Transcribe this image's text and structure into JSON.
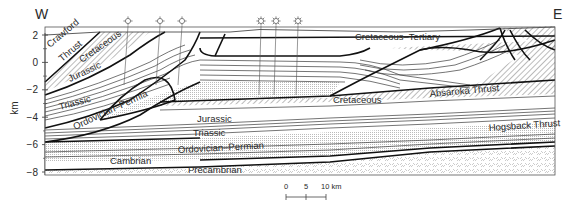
{
  "figure": {
    "direction_left": "W",
    "direction_right": "E",
    "axis": {
      "label": "km",
      "ticks": [
        {
          "value": 2,
          "label": "2"
        },
        {
          "value": 0,
          "label": "0"
        },
        {
          "value": -2,
          "label": "−2"
        },
        {
          "value": -4,
          "label": "−4"
        },
        {
          "value": -6,
          "label": "−6"
        },
        {
          "value": -8,
          "label": "−8"
        }
      ]
    },
    "unit_labels": {
      "crawford_thrust_1": "Crawford",
      "crawford_thrust_2": "Thrust",
      "cretaceous_upper": "Cretaceous",
      "jurassic_upper": "Jurassic",
      "triassic_upper": "Triassic",
      "ordovician_permian_upper": "Ordovician–Permia",
      "cretaceous_tertiary": "Cretaceous–Tertiary",
      "cretaceous_lower": "Cretaceous",
      "absaroka_thrust": "Absaroka Thrust",
      "jurassic_lower": "Jurassic",
      "triassic_lower": "Triassic",
      "hogsback_thrust": "Hogsback Thrust",
      "ordovician_permian_lower": "Ordovician–Permian",
      "cambrian": "Cambrian",
      "precambrian": "Precambrian"
    },
    "wells": [
      {
        "symbol": "dry-hole",
        "x": 128
      },
      {
        "symbol": "dry-hole",
        "x": 160
      },
      {
        "symbol": "dry-hole",
        "x": 182
      },
      {
        "symbol": "gas-well",
        "x": 261
      },
      {
        "symbol": "gas-well",
        "x": 276
      },
      {
        "symbol": "gas-well",
        "x": 298
      }
    ],
    "scale_bar": {
      "labels": [
        "0",
        "5",
        "10 km"
      ]
    },
    "colors": {
      "line": "#111111",
      "bed": "#3a3a3a",
      "background": "#ffffff"
    }
  }
}
